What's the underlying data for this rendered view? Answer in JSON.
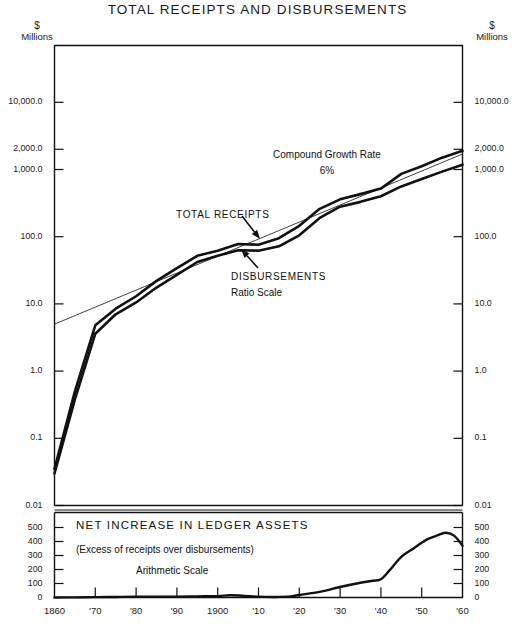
{
  "header": {
    "title": "TOTAL RECEIPTS AND DISBURSEMENTS"
  },
  "axes": {
    "unit_currency_left": "$",
    "unit_scale_left": "Millions",
    "unit_currency_right": "$",
    "unit_scale_right": "Millions"
  },
  "chart_data": {
    "type": "line",
    "title": "TOTAL RECEIPTS AND DISBURSEMENTS",
    "xlabel": "",
    "ylabel": "$ Millions",
    "grid": false,
    "legend_position": "inline-annotations",
    "panels": [
      {
        "name": "upper-log-panel",
        "scale": "log",
        "scale_note": "Ratio Scale",
        "ylim": [
          0.01,
          20000
        ],
        "ytick_values": [
          0.01,
          0.1,
          1.0,
          10.0,
          100.0,
          1000.0,
          2000.0,
          10000.0
        ],
        "ytick_labels": [
          "0.01",
          "0.1",
          "1.0",
          "10.0",
          "100.0",
          "1,000.0",
          "2,000.0",
          "10,000.0"
        ],
        "xlim": [
          1860,
          1960
        ],
        "series": [
          {
            "name": "TOTAL RECEIPTS",
            "x": [
              1860,
              1865,
              1870,
              1875,
              1880,
              1885,
              1890,
              1895,
              1900,
              1905,
              1910,
              1915,
              1920,
              1925,
              1930,
              1935,
              1940,
              1945,
              1950,
              1955,
              1960
            ],
            "values": [
              0.035,
              0.5,
              4.8,
              8.5,
              13.0,
              22.0,
              34.0,
              52.0,
              62.0,
              78.0,
              76.0,
              95.0,
              145.0,
              260.0,
              360.0,
              430.0,
              520.0,
              860.0,
              1120.0,
              1500.0,
              1900.0
            ]
          },
          {
            "name": "DISBURSEMENTS",
            "x": [
              1860,
              1865,
              1870,
              1875,
              1880,
              1885,
              1890,
              1895,
              1900,
              1905,
              1910,
              1915,
              1920,
              1925,
              1930,
              1935,
              1940,
              1945,
              1950,
              1955,
              1960
            ],
            "values": [
              0.03,
              0.38,
              3.6,
              7.0,
              10.5,
              17.5,
              27.0,
              42.0,
              52.0,
              63.0,
              62.0,
              72.0,
              105.0,
              190.0,
              280.0,
              330.0,
              400.0,
              560.0,
              720.0,
              930.0,
              1180.0
            ]
          },
          {
            "name": "Compound Growth Rate 6%",
            "style": "thin-trend-line",
            "x": [
              1860,
              1960
            ],
            "values": [
              5.0,
              1700.0
            ]
          }
        ],
        "annotations": [
          {
            "text": "Compound Growth Rate",
            "x": 1909,
            "y": 1500
          },
          {
            "text": "6%",
            "x": 1912,
            "y": 900
          },
          {
            "text": "TOTAL RECEIPTS",
            "x": 1890,
            "y": 210
          },
          {
            "text": "DISBURSEMENTS",
            "x": 1903,
            "y": 38
          },
          {
            "text": "Ratio Scale",
            "x": 1905,
            "y": 22
          }
        ]
      },
      {
        "name": "lower-arithmetic-panel",
        "scale": "linear",
        "scale_note": "Arithmetic Scale",
        "title": "NET INCREASE IN LEDGER ASSETS",
        "subtitle": "(Excess of receipts over disbursements)",
        "ylim": [
          0,
          560
        ],
        "ytick_values": [
          0,
          100,
          200,
          300,
          400,
          500
        ],
        "ytick_labels": [
          "0",
          "100",
          "200",
          "300",
          "400",
          "500"
        ],
        "xlim": [
          1860,
          1960
        ],
        "series": [
          {
            "name": "Net increase in ledger assets",
            "x": [
              1860,
              1865,
              1870,
              1875,
              1880,
              1885,
              1890,
              1895,
              1900,
              1903,
              1906,
              1910,
              1914,
              1918,
              1920,
              1925,
              1930,
              1935,
              1938,
              1940,
              1942,
              1945,
              1948,
              1951,
              1954,
              1956,
              1958,
              1960
            ],
            "values": [
              0,
              1,
              3,
              4,
              5,
              5,
              6,
              8,
              10,
              16,
              13,
              6,
              4,
              8,
              18,
              40,
              75,
              105,
              120,
              130,
              190,
              290,
              350,
              410,
              445,
              462,
              440,
              370
            ]
          }
        ]
      }
    ],
    "xtick_values": [
      1860,
      1870,
      1880,
      1890,
      1900,
      1910,
      1920,
      1930,
      1940,
      1950,
      1960
    ],
    "xtick_labels": [
      "1860",
      "'70",
      "'80",
      "'90",
      "1900",
      "'10",
      "'20",
      "'30",
      "'40",
      "'50",
      "'60"
    ]
  }
}
